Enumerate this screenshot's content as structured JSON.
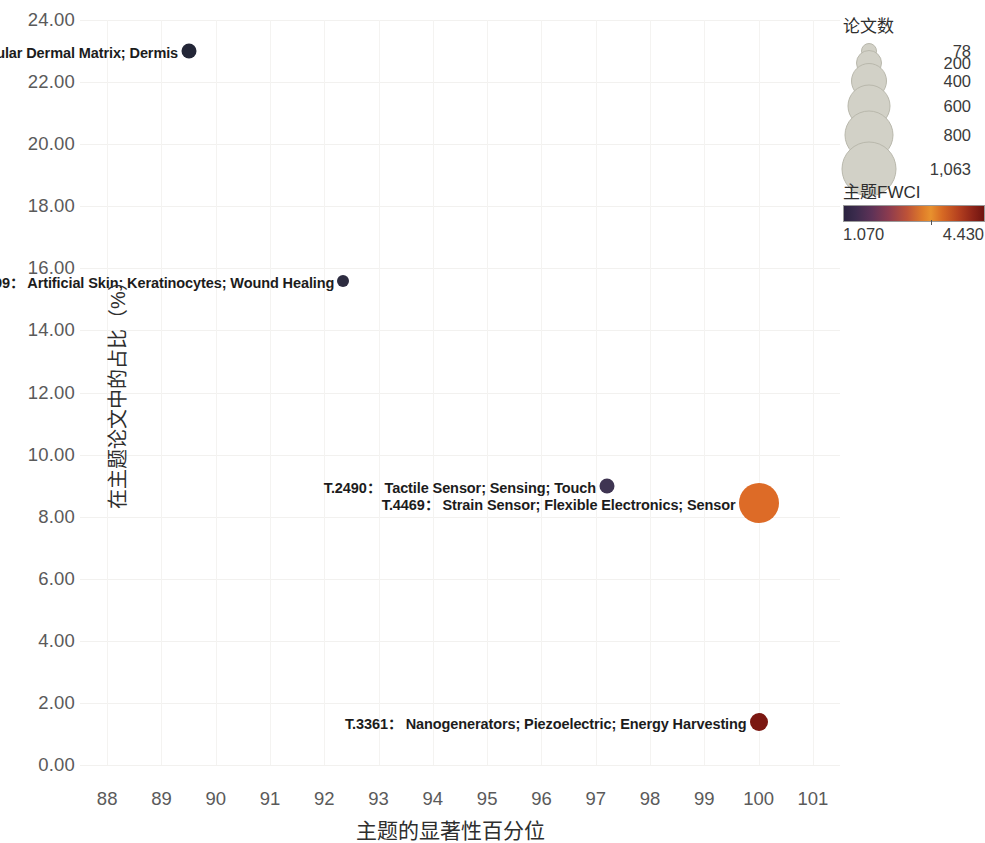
{
  "chart_data": {
    "type": "scatter",
    "title": "",
    "xlabel": "主题的显著性百分位",
    "ylabel": "在主题论文中的占比（%）",
    "xlim": [
      87.5,
      101.5
    ],
    "ylim": [
      0,
      24
    ],
    "xticks": [
      "88",
      "89",
      "90",
      "91",
      "92",
      "93",
      "94",
      "95",
      "96",
      "97",
      "98",
      "99",
      "100",
      "101"
    ],
    "xtick_values": [
      88,
      89,
      90,
      91,
      92,
      93,
      94,
      95,
      96,
      97,
      98,
      99,
      100,
      101
    ],
    "yticks": [
      "0.00",
      "2.00",
      "4.00",
      "6.00",
      "8.00",
      "10.00",
      "12.00",
      "14.00",
      "16.00",
      "18.00",
      "20.00",
      "22.00",
      "24.00"
    ],
    "ytick_values": [
      0,
      2,
      4,
      6,
      8,
      10,
      12,
      14,
      16,
      18,
      20,
      22,
      24
    ],
    "grid": true,
    "legend_position": "right",
    "size_encoding": "论文数",
    "color_encoding": "主题FWCI",
    "points": [
      {
        "id": "T.10068",
        "label": "T.10068：  Burns; Acellular Dermal Matrix; Dermis",
        "keywords": "Burns; Acellular Dermal Matrix; Dermis",
        "x": 89.5,
        "y": 23.0,
        "size": 78,
        "fwci": 1.07,
        "color": "#232637",
        "radius_px": 7.5,
        "label_side": "around"
      },
      {
        "id": "T.2699",
        "label": "T.2699：  Artificial Skin; Keratinocytes; Wound Healing",
        "keywords": "Artificial Skin; Keratinocytes; Wound Healing",
        "x": 92.35,
        "y": 15.6,
        "size": 90,
        "fwci": 1.2,
        "color": "#2d2c40",
        "radius_px": 6,
        "label_side": "around"
      },
      {
        "id": "T.2490",
        "label": "T.2490：  Tactile Sensor; Sensing; Touch",
        "keywords": "Tactile Sensor; Sensing; Touch",
        "x": 97.2,
        "y": 9.0,
        "size": 200,
        "fwci": 2.0,
        "color": "#3f3552",
        "radius_px": 7.5,
        "label_side": "left"
      },
      {
        "id": "T.4469",
        "label": "T.4469：  Strain Sensor; Flexible Electronics; Sensor",
        "keywords": "Strain Sensor; Flexible Electronics; Sensor",
        "x": 100.0,
        "y": 8.45,
        "size": 1063,
        "fwci": 3.3,
        "color": "#dd6b27",
        "radius_px": 20,
        "label_side": "left"
      },
      {
        "id": "T.3361",
        "label": "T.3361：  Nanogenerators; Piezoelectric; Energy Harvesting",
        "keywords": "Nanogenerators; Piezoelectric; Energy Harvesting",
        "x": 100.0,
        "y": 1.38,
        "size": 300,
        "fwci": 4.43,
        "color": "#7b1711",
        "radius_px": 9,
        "label_side": "left"
      }
    ]
  },
  "legend": {
    "size": {
      "title": "论文数",
      "items": [
        {
          "label": "78",
          "radius_px": 7
        },
        {
          "label": "200",
          "radius_px": 12
        },
        {
          "label": "400",
          "radius_px": 17
        },
        {
          "label": "600",
          "radius_px": 20.5
        },
        {
          "label": "800",
          "radius_px": 23.5
        },
        {
          "label": "1,063",
          "radius_px": 26.5
        }
      ]
    },
    "color": {
      "title": "主题FWCI",
      "min": "1.070",
      "max": "4.430"
    }
  }
}
